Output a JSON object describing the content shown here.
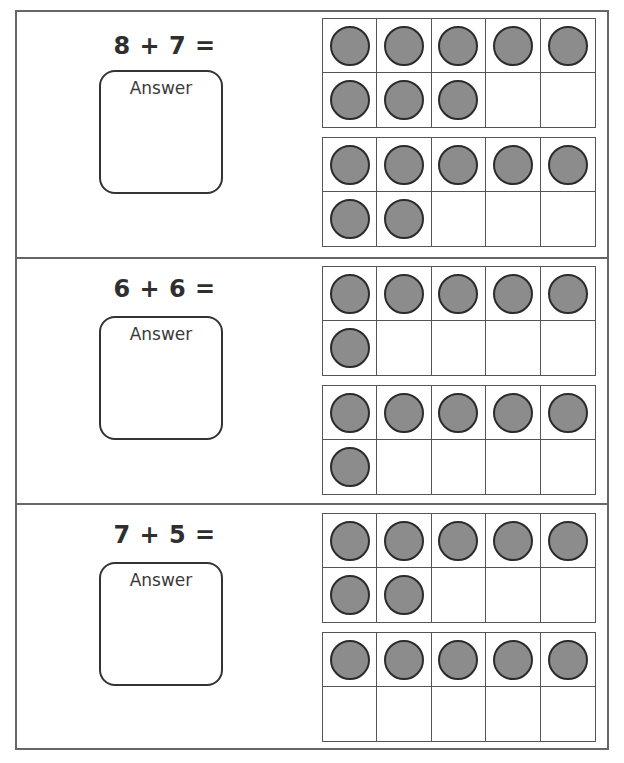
{
  "worksheet": {
    "problems": [
      {
        "equation": "8 + 7 =",
        "answer_label": "Answer",
        "addend_a": 8,
        "addend_b": 7,
        "frames": [
          {
            "filled": [
              true,
              true,
              true,
              true,
              true,
              true,
              true,
              true,
              false,
              false
            ]
          },
          {
            "filled": [
              true,
              true,
              true,
              true,
              true,
              true,
              true,
              false,
              false,
              false
            ]
          }
        ]
      },
      {
        "equation": "6 + 6 =",
        "answer_label": "Answer",
        "addend_a": 6,
        "addend_b": 6,
        "frames": [
          {
            "filled": [
              true,
              true,
              true,
              true,
              true,
              true,
              false,
              false,
              false,
              false
            ]
          },
          {
            "filled": [
              true,
              true,
              true,
              true,
              true,
              true,
              false,
              false,
              false,
              false
            ]
          }
        ]
      },
      {
        "equation": "7 + 5 =",
        "answer_label": "Answer",
        "addend_a": 7,
        "addend_b": 5,
        "frames": [
          {
            "filled": [
              true,
              true,
              true,
              true,
              true,
              true,
              true,
              false,
              false,
              false
            ]
          },
          {
            "filled": [
              true,
              true,
              true,
              true,
              true,
              false,
              false,
              false,
              false,
              false
            ]
          }
        ]
      }
    ],
    "colors": {
      "border": "#666666",
      "counter_fill": "#8c8c8c",
      "counter_outline": "#2b2b2b",
      "text": "#333333"
    }
  }
}
